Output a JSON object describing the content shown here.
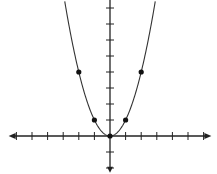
{
  "chart_data": {
    "type": "line",
    "title": "",
    "xlabel": "",
    "ylabel": "",
    "function": "y = x^2",
    "series": [
      {
        "name": "y = x^2",
        "curve_domain": [
          -2.9,
          2.9
        ],
        "marked_points": [
          {
            "x": -2,
            "y": 4
          },
          {
            "x": -1,
            "y": 1
          },
          {
            "x": 0,
            "y": 0
          },
          {
            "x": 1,
            "y": 1
          },
          {
            "x": 2,
            "y": 4
          }
        ]
      }
    ],
    "xlim": [
      -6.5,
      6.5
    ],
    "ylim": [
      -2.3,
      8.6
    ],
    "x_ticks": [
      -6,
      -5,
      -4,
      -3,
      -2,
      -1,
      1,
      2,
      3,
      4,
      5,
      6
    ],
    "y_ticks": [
      -2,
      -1,
      1,
      2,
      3,
      4,
      5,
      6,
      7,
      8
    ],
    "tick_labels_shown": false,
    "grid": false,
    "legend": "none",
    "axes_arrows": true
  },
  "style": {
    "axis_color": "#222222",
    "curve_color": "#333333",
    "point_color": "#111111",
    "background": "#ffffff"
  },
  "layout": {
    "origin_px": [
      110,
      136
    ],
    "unit_px_x": 15.6,
    "unit_px_y": 16
  }
}
